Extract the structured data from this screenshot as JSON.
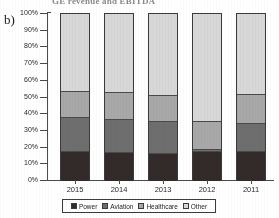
{
  "figure": {
    "panel_label": "b)",
    "cut_off_caption": "GE revenue and EBITDA",
    "legend_position": "bottom-center"
  },
  "chart_data": {
    "type": "bar",
    "stacked": true,
    "normalized": true,
    "title": "",
    "xlabel": "",
    "ylabel": "",
    "ylim": [
      0,
      100
    ],
    "ytick_labels": [
      "0%",
      "10%",
      "20%",
      "30%",
      "40%",
      "50%",
      "60%",
      "70%",
      "80%",
      "90%",
      "100%"
    ],
    "ytick_values": [
      0,
      10,
      20,
      30,
      40,
      50,
      60,
      70,
      80,
      90,
      100
    ],
    "grid": false,
    "categories": [
      "2015",
      "2014",
      "2013",
      "2012",
      "2011"
    ],
    "series": [
      {
        "name": "Power",
        "color": "#332a2a",
        "values": [
          18.0,
          17.5,
          16.5,
          18.0,
          18.0
        ]
      },
      {
        "name": "Aviation",
        "color": "#6e6e6e",
        "values": [
          20.5,
          19.5,
          19.5,
          1.0,
          17.0
        ]
      },
      {
        "name": "Healthcare",
        "color": "#a8a8a8",
        "values": [
          15.5,
          16.0,
          15.5,
          17.0,
          17.0
        ]
      },
      {
        "name": "Other",
        "color": "#d8d8d8",
        "values": [
          46.0,
          47.0,
          48.5,
          64.0,
          48.0
        ]
      }
    ],
    "cumulative_tops": {
      "2015": [
        18.0,
        38.5,
        54.0,
        100.0
      ],
      "2014": [
        17.5,
        37.0,
        53.0,
        100.0
      ],
      "2013": [
        16.5,
        36.0,
        51.5,
        100.0
      ],
      "2012": [
        18.0,
        19.0,
        36.0,
        100.0
      ],
      "2011": [
        18.0,
        35.0,
        52.0,
        100.0
      ]
    },
    "legend": [
      "Power",
      "Aviation",
      "Healthcare",
      "Other"
    ]
  }
}
